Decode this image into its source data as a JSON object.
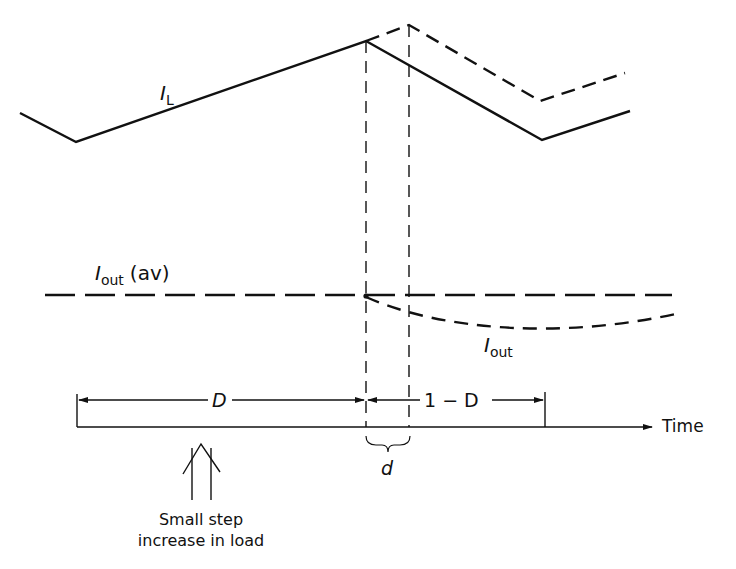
{
  "diagram": {
    "type": "waveform-timing",
    "colors": {
      "ink": "#111111",
      "background": "#ffffff"
    },
    "labels": {
      "inductor_current": {
        "symbol": "I",
        "subscript": "L"
      },
      "output_current_avg": {
        "symbol": "I",
        "subscript": "out",
        "suffix": "(av)"
      },
      "output_current": {
        "symbol": "I",
        "subscript": "out"
      },
      "duty_on": "D",
      "duty_off": "1 − D",
      "delta": "d",
      "time_axis": "Time",
      "annotation_line1": "Small step",
      "annotation_line2": "increase in load"
    },
    "waveforms": {
      "inductor_current_solid": [
        [
          20,
          113
        ],
        [
          76,
          142
        ],
        [
          366,
          41
        ],
        [
          542,
          140
        ],
        [
          630,
          111
        ]
      ],
      "inductor_current_dashed": [
        [
          366,
          41
        ],
        [
          409,
          25
        ],
        [
          540,
          101
        ],
        [
          625,
          73
        ]
      ],
      "output_avg_y": 295,
      "output_curve": "M366,297 C440,330 560,340 680,313"
    }
  }
}
